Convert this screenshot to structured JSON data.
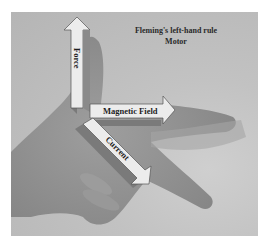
{
  "figure": {
    "title_line1": "Fleming's left-hand rule",
    "title_line2": "Motor",
    "arrows": {
      "force": "Force",
      "magnetic_field": "Magnetic Field",
      "current": "Current"
    },
    "colors": {
      "background": "#b8b8b8",
      "arrow_face": "#e6e6e6",
      "arrow_side": "#7a7a7a",
      "hand": "#8f8f8f"
    }
  }
}
